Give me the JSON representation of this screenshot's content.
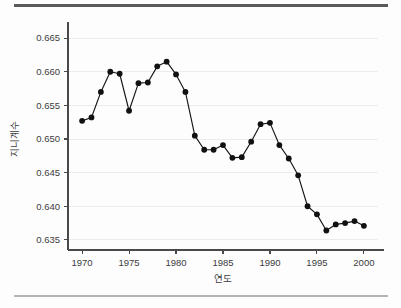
{
  "figure": {
    "background_color": "#fdfdfd",
    "rule_top_color": "#5a5a5a",
    "rule_bottom_color": "#b4b4b4"
  },
  "chart_data": {
    "type": "line",
    "title": "",
    "xlabel": "연도",
    "ylabel": "지니계수",
    "xlim": [
      1968.5,
      2001.5
    ],
    "ylim": [
      0.6335,
      0.6665
    ],
    "grid": true,
    "grid_axis": "y",
    "legend": false,
    "legend_position": "none",
    "marker": "circle",
    "marker_color": "#111111",
    "line_color": "#161616",
    "xticks": [
      1970,
      1975,
      1980,
      1985,
      1990,
      1995,
      2000
    ],
    "xtick_labels": [
      "1970",
      "1975",
      "1980",
      "1985",
      "1990",
      "1995",
      "2000"
    ],
    "yticks": [
      0.635,
      0.64,
      0.645,
      0.65,
      0.655,
      0.66,
      0.665
    ],
    "ytick_labels": [
      "0.635",
      "0.640",
      "0.645",
      "0.650",
      "0.655",
      "0.660",
      "0.665"
    ],
    "x": [
      1970,
      1971,
      1972,
      1973,
      1974,
      1975,
      1976,
      1977,
      1978,
      1979,
      1980,
      1981,
      1982,
      1983,
      1984,
      1985,
      1986,
      1987,
      1988,
      1989,
      1990,
      1991,
      1992,
      1993,
      1994,
      1995,
      1996,
      1997,
      1998,
      1999,
      2000
    ],
    "values": [
      0.6527,
      0.6532,
      0.657,
      0.66,
      0.6597,
      0.6542,
      0.6583,
      0.6584,
      0.6608,
      0.6615,
      0.6596,
      0.657,
      0.6505,
      0.6484,
      0.6484,
      0.6491,
      0.6472,
      0.6473,
      0.6496,
      0.6522,
      0.6524,
      0.6491,
      0.6471,
      0.6446,
      0.64,
      0.6388,
      0.6364,
      0.6373,
      0.6375,
      0.6378,
      0.6371
    ],
    "series": [
      {
        "name": "지니계수",
        "values": [
          0.6527,
          0.6532,
          0.657,
          0.66,
          0.6597,
          0.6542,
          0.6583,
          0.6584,
          0.6608,
          0.6615,
          0.6596,
          0.657,
          0.6505,
          0.6484,
          0.6484,
          0.6491,
          0.6472,
          0.6473,
          0.6496,
          0.6522,
          0.6524,
          0.6491,
          0.6471,
          0.6446,
          0.64,
          0.6388,
          0.6364,
          0.6373,
          0.6375,
          0.6378,
          0.6371
        ]
      }
    ]
  }
}
